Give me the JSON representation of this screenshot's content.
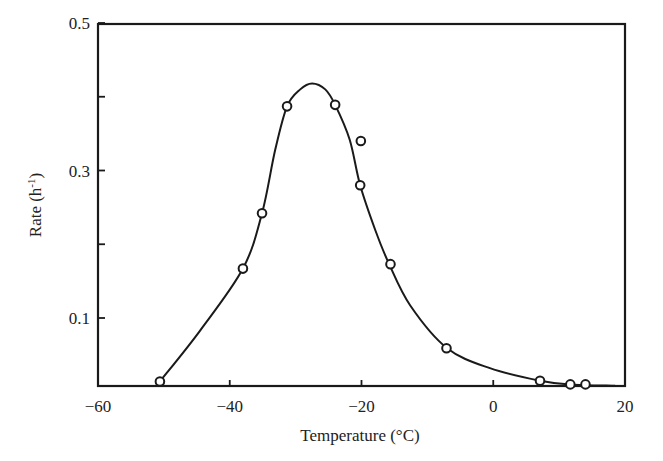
{
  "chart_data": {
    "type": "scatter",
    "title": "",
    "xlabel": "Temperature (°C)",
    "ylabel": "Rate (h⁻¹)",
    "xlim": [
      -60,
      20
    ],
    "ylim": [
      0.008,
      0.5
    ],
    "x_ticks": [
      -60,
      -40,
      -20,
      0,
      20
    ],
    "x_tick_labels": [
      "−60",
      "−40",
      "−20",
      "0",
      "20"
    ],
    "y_ticks": [
      0.1,
      0.2,
      0.3,
      0.4,
      0.5
    ],
    "y_tick_labels": [
      "0.1",
      "",
      "0.3",
      "",
      "0.5"
    ],
    "grid": false,
    "legend": null,
    "series": [
      {
        "name": "Measured rate",
        "marker": "open-circle",
        "x": [
          -50.6,
          -38.0,
          -35.1,
          -31.3,
          -24.0,
          -20.1,
          -20.2,
          -15.6,
          -7.1,
          7.1,
          11.7,
          14.0
        ],
        "y": [
          0.014,
          0.167,
          0.242,
          0.387,
          0.389,
          0.34,
          0.28,
          0.173,
          0.059,
          0.015,
          0.01,
          0.01
        ]
      },
      {
        "name": "Fitted curve",
        "marker": "none",
        "line": "solid",
        "x": [
          -50.6,
          -44.5,
          -38.0,
          -35.1,
          -33.1,
          -31.3,
          -29.3,
          -27.5,
          -25.5,
          -24.0,
          -21.8,
          -20.2,
          -17.9,
          -15.9,
          -12.6,
          -7.0,
          -0.5,
          7.1,
          11.7,
          18.5
        ],
        "y": [
          0.014,
          0.083,
          0.167,
          0.242,
          0.328,
          0.387,
          0.41,
          0.418,
          0.41,
          0.389,
          0.342,
          0.28,
          0.219,
          0.175,
          0.117,
          0.059,
          0.032,
          0.015,
          0.01,
          0.008
        ]
      }
    ],
    "peak": {
      "x": -27.5,
      "y": 0.418
    }
  },
  "axes": {
    "x_label": "Temperature (°C)",
    "y_label_main": "Rate (h",
    "y_label_sup": "-1",
    "y_label_close": ")"
  }
}
